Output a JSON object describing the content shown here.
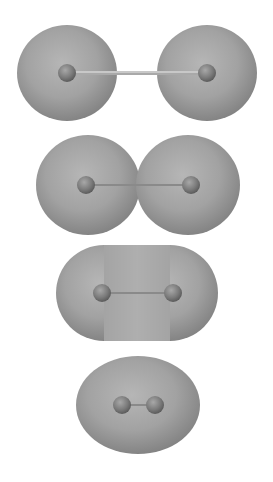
{
  "figure": {
    "background": "#ffffff",
    "colors": {
      "surface_light": "#b4b4b4",
      "surface_mid": "#9a9a9a",
      "surface_dark": "#7c7c7c",
      "atom_light": "#9e9e9e",
      "atom_dark": "#5e5e5e",
      "bond": "#8a8a8a"
    },
    "panels": [
      {
        "id": "separated",
        "shape": "two-spheres",
        "lobes": [
          {
            "cx": 67,
            "cy": 73,
            "rx": 50,
            "ry": 48
          },
          {
            "cx": 207,
            "cy": 73,
            "rx": 50,
            "ry": 48
          }
        ],
        "atoms": [
          {
            "cx": 67,
            "cy": 73,
            "r": 9
          },
          {
            "cx": 207,
            "cy": 73,
            "r": 9
          }
        ]
      },
      {
        "id": "peanut",
        "shape": "two-overlapping-lobes",
        "lobes": [
          {
            "cx": 88,
            "cy": 185,
            "rx": 52,
            "ry": 50
          },
          {
            "cx": 188,
            "cy": 185,
            "rx": 52,
            "ry": 50
          }
        ],
        "atoms": [
          {
            "cx": 86,
            "cy": 185,
            "r": 9
          },
          {
            "cx": 191,
            "cy": 185,
            "r": 9
          }
        ]
      },
      {
        "id": "capsule",
        "shape": "capsule",
        "lobes": [
          {
            "cx": 104,
            "cy": 293,
            "rx": 48,
            "ry": 48
          },
          {
            "cx": 170,
            "cy": 293,
            "rx": 48,
            "ry": 48
          }
        ],
        "atoms": [
          {
            "cx": 102,
            "cy": 293,
            "r": 9
          },
          {
            "cx": 173,
            "cy": 293,
            "r": 9
          }
        ]
      },
      {
        "id": "ellipsoid",
        "shape": "ellipse",
        "lobes": [
          {
            "cx": 138,
            "cy": 405,
            "rx": 62,
            "ry": 49
          }
        ],
        "atoms": [
          {
            "cx": 122,
            "cy": 405,
            "r": 9
          },
          {
            "cx": 155,
            "cy": 405,
            "r": 9
          }
        ]
      }
    ]
  }
}
